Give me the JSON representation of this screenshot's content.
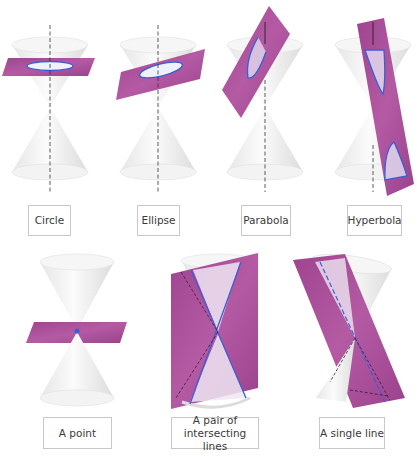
{
  "colors": {
    "plane": "#a0428f",
    "plane_light": "#b85aa6",
    "curve": "#3c5fd0",
    "cone": "#f1f1f1",
    "cone_shade": "#d9d9d9",
    "axis": "#333333",
    "label_border": "#c8c8c8"
  },
  "panels": [
    {
      "id": "circle",
      "label": "Circle"
    },
    {
      "id": "ellipse",
      "label": "Ellipse"
    },
    {
      "id": "parabola",
      "label": "Parabola"
    },
    {
      "id": "hyperbola",
      "label": "Hyperbola"
    },
    {
      "id": "point",
      "label": "A point"
    },
    {
      "id": "intersecting-lines",
      "label": "A pair of\nintersecting lines"
    },
    {
      "id": "single-line",
      "label": "A single line"
    }
  ]
}
